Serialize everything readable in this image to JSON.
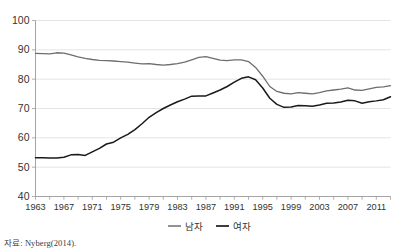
{
  "chart_data": {
    "type": "line",
    "title": "",
    "subtitle": "",
    "xlabel": "",
    "ylabel": "",
    "xlim": [
      1963,
      2013
    ],
    "ylim": [
      40,
      100
    ],
    "yticks": [
      40,
      50,
      60,
      70,
      80,
      90,
      100
    ],
    "xticks": [
      1963,
      1967,
      1971,
      1975,
      1979,
      1983,
      1987,
      1991,
      1995,
      1999,
      2003,
      2007,
      2011
    ],
    "grid": "horizontal",
    "legend_position": "bottom-center",
    "x": [
      1963,
      1964,
      1965,
      1966,
      1967,
      1968,
      1969,
      1970,
      1971,
      1972,
      1973,
      1974,
      1975,
      1976,
      1977,
      1978,
      1979,
      1980,
      1981,
      1982,
      1983,
      1984,
      1985,
      1986,
      1987,
      1988,
      1989,
      1990,
      1991,
      1992,
      1993,
      1994,
      1995,
      1996,
      1997,
      1998,
      1999,
      2000,
      2001,
      2002,
      2003,
      2004,
      2005,
      2006,
      2007,
      2008,
      2009,
      2010,
      2011,
      2012,
      2013
    ],
    "series": [
      {
        "name": "남자",
        "color": "#6e6e6e",
        "values": [
          88.8,
          88.7,
          88.6,
          89.0,
          88.9,
          88.3,
          87.6,
          87.1,
          86.7,
          86.4,
          86.3,
          86.2,
          86.0,
          85.8,
          85.5,
          85.2,
          85.3,
          85.0,
          84.8,
          85.0,
          85.3,
          85.8,
          86.6,
          87.4,
          87.7,
          87.1,
          86.5,
          86.3,
          86.6,
          86.6,
          86.0,
          84.0,
          81.0,
          77.5,
          75.8,
          75.2,
          75.0,
          75.4,
          75.2,
          75.0,
          75.4,
          76.0,
          76.3,
          76.6,
          77.0,
          76.3,
          76.2,
          76.7,
          77.2,
          77.4,
          77.8
        ]
      },
      {
        "name": "여자",
        "color": "#1a1a1a",
        "values": [
          53.2,
          53.2,
          53.1,
          53.1,
          53.4,
          54.2,
          54.3,
          54.0,
          55.2,
          56.4,
          57.9,
          58.5,
          60.0,
          61.2,
          62.8,
          64.8,
          67.0,
          68.6,
          70.0,
          71.2,
          72.3,
          73.2,
          74.2,
          74.3,
          74.3,
          75.3,
          76.3,
          77.5,
          79.0,
          80.3,
          80.8,
          79.8,
          77.0,
          73.5,
          71.4,
          70.4,
          70.5,
          71.0,
          70.9,
          70.8,
          71.2,
          71.8,
          71.9,
          72.2,
          72.8,
          72.6,
          71.8,
          72.3,
          72.6,
          73.0,
          74.0
        ]
      }
    ]
  },
  "legend": {
    "items": [
      {
        "label": "남자",
        "color": "#6e6e6e"
      },
      {
        "label": "여자",
        "color": "#1a1a1a"
      }
    ]
  },
  "axes": {
    "y_labels": [
      "100",
      "90",
      "80",
      "70",
      "60",
      "50",
      "40"
    ],
    "x_labels": [
      "1963",
      "1967",
      "1971",
      "1975",
      "1979",
      "1983",
      "1987",
      "1991",
      "1995",
      "1999",
      "2003",
      "2007",
      "2011"
    ]
  },
  "footnote": {
    "source": "자료: Nyberg(2014)."
  }
}
